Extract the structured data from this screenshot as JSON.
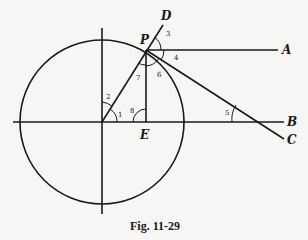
{
  "figure": {
    "caption": "Fig. 11-29",
    "points": {
      "P": "P",
      "D": "D",
      "A": "A",
      "B": "B",
      "C": "C",
      "E": "E"
    },
    "angles": [
      "1",
      "2",
      "3",
      "4",
      "5",
      "6",
      "7",
      "8"
    ],
    "colors": {
      "ink": "#1a1a1a",
      "paper": "#f6f6f4"
    }
  }
}
